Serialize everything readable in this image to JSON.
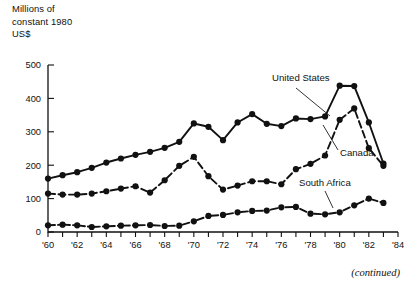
{
  "axis_title": "Millions of\nconstant 1980\nUS$",
  "footer_note": "(continued)",
  "series_labels": {
    "united_states": "United States",
    "canada": "Canada",
    "south_africa": "South Africa"
  },
  "chart_data": {
    "type": "line",
    "title": "",
    "subtitle": "",
    "xlabel": "",
    "ylabel": "Millions of constant 1980 US$",
    "ylim": [
      0,
      500
    ],
    "xlim": [
      1960,
      1984
    ],
    "grid": false,
    "legend_position": "inline-annotations",
    "y_ticks": [
      0,
      100,
      200,
      300,
      400,
      500
    ],
    "y_tick_labels": [
      "0",
      "100",
      "200",
      "300",
      "400",
      "500"
    ],
    "x_ticks": [
      1960,
      1961,
      1962,
      1963,
      1964,
      1965,
      1966,
      1967,
      1968,
      1969,
      1970,
      1971,
      1972,
      1973,
      1974,
      1975,
      1976,
      1977,
      1978,
      1979,
      1980,
      1981,
      1982,
      1983,
      1984
    ],
    "x_tick_labels": [
      "'60",
      "",
      "'62",
      "",
      "'64",
      "",
      "'66",
      "",
      "'68",
      "",
      "'70",
      "",
      "'72",
      "",
      "'74",
      "",
      "'76",
      "",
      "'78",
      "",
      "'80",
      "",
      "'82",
      "",
      "'84"
    ],
    "x": [
      1960,
      1961,
      1962,
      1963,
      1964,
      1965,
      1966,
      1967,
      1968,
      1969,
      1970,
      1971,
      1972,
      1973,
      1974,
      1975,
      1976,
      1977,
      1978,
      1979,
      1980,
      1981,
      1982,
      1983
    ],
    "series": [
      {
        "name": "United States",
        "style": "solid",
        "marker": "filled-circle",
        "values": [
          160,
          170,
          179,
          192,
          208,
          220,
          231,
          240,
          252,
          270,
          325,
          315,
          275,
          328,
          353,
          324,
          317,
          340,
          338,
          346,
          438,
          437,
          328,
          205
        ]
      },
      {
        "name": "Canada",
        "style": "dashed",
        "marker": "filled-circle",
        "values": [
          115,
          112,
          112,
          115,
          122,
          130,
          137,
          118,
          155,
          198,
          225,
          167,
          127,
          139,
          152,
          152,
          143,
          188,
          204,
          229,
          336,
          370,
          251,
          198
        ]
      },
      {
        "name": "South Africa",
        "style": "dash-dot",
        "marker": "filled-circle",
        "values": [
          20,
          22,
          20,
          15,
          17,
          19,
          20,
          21,
          18,
          19,
          32,
          48,
          51,
          59,
          63,
          64,
          74,
          75,
          55,
          53,
          59,
          80,
          100,
          87
        ]
      }
    ],
    "annotations": [
      {
        "text": "United States",
        "series": "United States",
        "points_to_year": 1977
      },
      {
        "text": "Canada",
        "series": "Canada",
        "points_to_year": 1980
      },
      {
        "text": "South Africa",
        "series": "South Africa",
        "points_to_year": 1979
      }
    ]
  },
  "colors": {
    "ink": "#111111",
    "background": "#ffffff"
  }
}
